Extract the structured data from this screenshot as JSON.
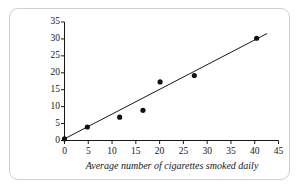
{
  "figure": {
    "frame_border_color": "#cfcfcf",
    "background_color": "#ffffff"
  },
  "chart_data": {
    "type": "scatter",
    "title": "",
    "subtitle": "",
    "xlabel": "Average number of cigarettes smoked daily",
    "ylabel": "Annual death rate/10,000 men",
    "xlim": [
      0,
      45
    ],
    "ylim": [
      0,
      35
    ],
    "xticks": [
      0,
      5,
      10,
      15,
      20,
      25,
      30,
      35,
      40,
      45
    ],
    "yticks": [
      0,
      5,
      10,
      15,
      20,
      25,
      30,
      35
    ],
    "xtick_labels": [
      "0",
      "5",
      "10",
      "15",
      "20",
      "25",
      "30",
      "35",
      "40",
      "45"
    ],
    "ytick_labels": [
      "0",
      "5",
      "10",
      "15",
      "20",
      "25",
      "30",
      "35"
    ],
    "grid": false,
    "legend": null,
    "legend_position": "none",
    "annotations": [],
    "marker_color": "#101214",
    "marker_size": 4,
    "series": [
      {
        "name": "Observed death rate",
        "marker": "filled-circle",
        "points": [
          {
            "x": 0.0,
            "y": 0.5
          },
          {
            "x": 4.8,
            "y": 4.0
          },
          {
            "x": 11.6,
            "y": 6.9
          },
          {
            "x": 16.5,
            "y": 8.9
          },
          {
            "x": 20.1,
            "y": 17.3
          },
          {
            "x": 27.3,
            "y": 19.2
          },
          {
            "x": 40.4,
            "y": 30.2
          }
        ]
      }
    ],
    "trend_line": {
      "name": "Least squares regression line",
      "color": "#15171a",
      "x_start": 0.0,
      "y_start": 0.5,
      "x_end": 42.6,
      "y_end": 31.6
    }
  }
}
